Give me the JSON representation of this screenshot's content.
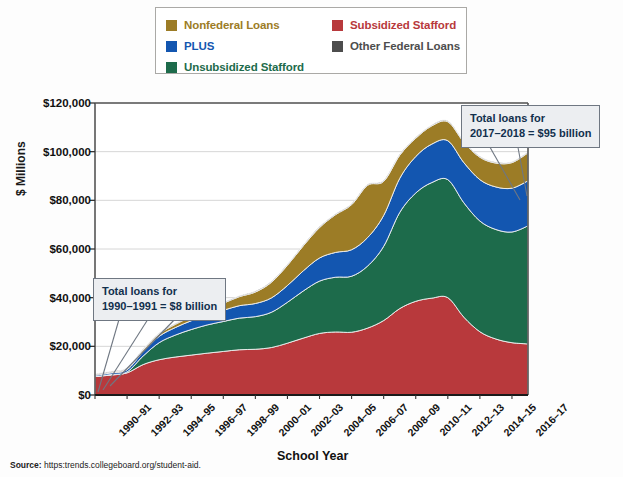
{
  "legend": {
    "items": [
      {
        "label": "Nonfederal Loans",
        "color": "#9c7c26",
        "col": "left",
        "row": 0
      },
      {
        "label": "PLUS",
        "color": "#1356b0",
        "col": "left",
        "row": 1
      },
      {
        "label": "Unsubsidized Stafford",
        "color": "#1d6b4b",
        "col": "left",
        "row": 2
      },
      {
        "label": "Subsidized Stafford",
        "color": "#b8393c",
        "col": "right",
        "row": 0
      },
      {
        "label": "Other Federal Loans",
        "color": "#4d4d4d",
        "col": "right",
        "row": 1
      }
    ]
  },
  "annotations": [
    {
      "name": "callout-1990",
      "line1": "Total loans for",
      "line2": "1990–1991 = $8 billion"
    },
    {
      "name": "callout-2017",
      "line1": "Total loans for",
      "line2": "2017–2018 = $95 billion"
    }
  ],
  "source": {
    "prefix": "Source:",
    "text": " https:trends.collegeboard.org/student-aid."
  },
  "chart_data": {
    "type": "area",
    "stacked": true,
    "title": "",
    "xlabel": "School Year",
    "ylabel": "$ Millions",
    "ylim": [
      0,
      120000
    ],
    "yticks": [
      0,
      20000,
      40000,
      60000,
      80000,
      100000,
      120000
    ],
    "ytick_labels": [
      "$0",
      "$20,000",
      "$40,000",
      "$60,000",
      "$80,000",
      "$100,000",
      "$120,000"
    ],
    "grid": true,
    "legend_position": "top",
    "x": [
      "1990-91",
      "1991-92",
      "1992-93",
      "1993-94",
      "1994-95",
      "1995-96",
      "1996-97",
      "1997-98",
      "1998-99",
      "1999-00",
      "2000-01",
      "2001-02",
      "2002-03",
      "2003-04",
      "2004-05",
      "2005-06",
      "2006-07",
      "2007-08",
      "2008-09",
      "2009-10",
      "2010-11",
      "2011-12",
      "2012-13",
      "2013-14",
      "2014-15",
      "2015-16",
      "2016-17",
      "2017-18"
    ],
    "xtick_labels": [
      "1990–91",
      "1992–93",
      "1994–95",
      "1996–97",
      "1998–99",
      "2000–01",
      "2002–03",
      "2004–05",
      "2006–07",
      "2008–09",
      "2010–11",
      "2012–13",
      "2014–15",
      "2016–17"
    ],
    "xtick_indices": [
      0,
      2,
      4,
      6,
      8,
      10,
      12,
      14,
      16,
      18,
      20,
      22,
      24,
      26
    ],
    "series": [
      {
        "name": "Subsidized Stafford",
        "color": "#b8393c",
        "values": [
          7600,
          8200,
          9100,
          12500,
          14500,
          15600,
          16400,
          17200,
          17900,
          18600,
          18800,
          19500,
          21300,
          23400,
          25300,
          25900,
          25800,
          27500,
          30600,
          35500,
          38500,
          39800,
          40000,
          32000,
          26000,
          23000,
          21500,
          21000
        ]
      },
      {
        "name": "Unsubsidized Stafford",
        "color": "#1d6b4b",
        "values": [
          0,
          200,
          400,
          3500,
          7000,
          9000,
          10500,
          11600,
          12300,
          13000,
          13400,
          14500,
          16800,
          19400,
          21500,
          22500,
          23000,
          25500,
          30500,
          39500,
          44500,
          47500,
          48500,
          47000,
          45500,
          45000,
          45500,
          48500
        ]
      },
      {
        "name": "PLUS",
        "color": "#1356b0",
        "values": [
          500,
          700,
          900,
          1800,
          2600,
          3100,
          3600,
          4100,
          4600,
          5100,
          5400,
          5900,
          6900,
          8300,
          9500,
          10200,
          10900,
          11700,
          12700,
          14000,
          15000,
          15800,
          16000,
          16500,
          17000,
          17500,
          18000,
          18500
        ]
      },
      {
        "name": "Nonfederal Loans",
        "color": "#9c7c26",
        "values": [
          200,
          300,
          400,
          700,
          1000,
          1300,
          1700,
          2200,
          2900,
          3700,
          4700,
          6400,
          8300,
          10300,
          12500,
          15500,
          18500,
          21500,
          14000,
          9500,
          7500,
          7500,
          7800,
          8400,
          9200,
          9800,
          10500,
          11500
        ]
      },
      {
        "name": "Other Federal Loans",
        "color": "#4d4d4d",
        "values": [
          300,
          300,
          300,
          300,
          300,
          300,
          300,
          300,
          300,
          300,
          300,
          300,
          300,
          300,
          300,
          300,
          300,
          300,
          300,
          300,
          300,
          300,
          300,
          300,
          300,
          300,
          300,
          300
        ]
      }
    ],
    "totals_annotated": {
      "1990-91": 8000,
      "2017-18": 95000
    }
  }
}
